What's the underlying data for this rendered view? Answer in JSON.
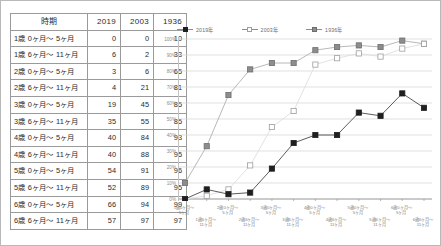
{
  "table": {
    "headers": [
      "時期",
      "2019",
      "2003",
      "1936"
    ],
    "rows": [
      {
        "period": "1歳 0ヶ月～ 5ヶ月",
        "y2019": "0",
        "y2003": "0",
        "y1936": "10"
      },
      {
        "period": "1歳 6ヶ月～ 11ヶ月",
        "y2019": "6",
        "y2003": "2",
        "y1936": "33"
      },
      {
        "period": "2歳 0ヶ月～ 5ヶ月",
        "y2019": "3",
        "y2003": "6",
        "y1936": "65"
      },
      {
        "period": "2歳 6ヶ月～ 11ヶ月",
        "y2019": "4",
        "y2003": "21",
        "y1936": "81"
      },
      {
        "period": "3歳 0ヶ月～ 5ヶ月",
        "y2019": "19",
        "y2003": "45",
        "y1936": "85"
      },
      {
        "period": "3歳 6ヶ月～ 11ヶ月",
        "y2019": "35",
        "y2003": "55",
        "y1936": "85"
      },
      {
        "period": "4歳 0ヶ月～ 5ヶ月",
        "y2019": "40",
        "y2003": "84",
        "y1936": "93"
      },
      {
        "period": "4歳 6ヶ月～ 11ヶ月",
        "y2019": "40",
        "y2003": "88",
        "y1936": "95"
      },
      {
        "period": "5歳 0ヶ月～ 5ヶ月",
        "y2019": "54",
        "y2003": "91",
        "y1936": "96"
      },
      {
        "period": "5歳 6ヶ月～ 11ヶ月",
        "y2019": "52",
        "y2003": "89",
        "y1936": "95"
      },
      {
        "period": "6歳 0ヶ月～ 5ヶ月",
        "y2019": "66",
        "y2003": "94",
        "y1936": "99"
      },
      {
        "period": "6歳 6ヶ月～ 11ヶ月",
        "y2019": "57",
        "y2003": "97",
        "y1936": "97"
      }
    ]
  },
  "chart_data": {
    "type": "line",
    "title": "",
    "xlabel": "",
    "ylabel": "",
    "ylim": [
      0,
      100
    ],
    "ytick_labels": [
      "0%",
      "10%",
      "20%",
      "30%",
      "40%",
      "50%",
      "60%",
      "70%",
      "80%",
      "90%",
      "100%"
    ],
    "ytick_values": [
      0,
      10,
      20,
      30,
      40,
      50,
      60,
      70,
      80,
      90,
      100
    ],
    "grid": true,
    "legend_position": "top-left",
    "categories": [
      "1歳0ヶ月～\n5ヶ月",
      "1歳6ヶ月～\n11ヶ月",
      "2歳0ヶ月～\n5ヶ月",
      "2歳6ヶ月～\n11ヶ月",
      "3歳0ヶ月～\n5ヶ月",
      "3歳6ヶ月～\n11ヶ月",
      "4歳0ヶ月～\n5ヶ月",
      "4歳6ヶ月～\n11ヶ月",
      "5歳0ヶ月～\n5ヶ月",
      "5歳6ヶ月～\n11ヶ月",
      "6歳0ヶ月～\n5ヶ月",
      "6歳6ヶ月～\n11ヶ月"
    ],
    "categories_line1": [
      "1歳0ヶ月～",
      "1歳6ヶ月～",
      "2歳0ヶ月～",
      "2歳6ヶ月～",
      "3歳0ヶ月～",
      "3歳6ヶ月～",
      "4歳0ヶ月～",
      "4歳6ヶ月～",
      "5歳0ヶ月～",
      "5歳6ヶ月～",
      "6歳0ヶ月～",
      "6歳6ヶ月～"
    ],
    "categories_line2": [
      "5ヶ月",
      "11ヶ月",
      "5ヶ月",
      "11ヶ月",
      "5ヶ月",
      "11ヶ月",
      "5ヶ月",
      "11ヶ月",
      "5ヶ月",
      "11ヶ月",
      "5ヶ月",
      "11ヶ月"
    ],
    "series": [
      {
        "name": "2019年",
        "color": "#1f1f1f",
        "marker": "filled-square",
        "values": [
          0,
          6,
          3,
          4,
          19,
          35,
          40,
          40,
          54,
          52,
          66,
          57
        ]
      },
      {
        "name": "2003年",
        "color": "#d8d8d8",
        "marker": "open-square",
        "values": [
          0,
          2,
          6,
          21,
          45,
          55,
          84,
          88,
          91,
          89,
          94,
          97
        ]
      },
      {
        "name": "1936年",
        "color": "#8d8d8d",
        "marker": "gray-square",
        "values": [
          10,
          33,
          65,
          81,
          85,
          85,
          93,
          95,
          96,
          95,
          99,
          97
        ]
      }
    ]
  },
  "legend": {
    "items": [
      {
        "label": "2019年"
      },
      {
        "label": "2003年"
      },
      {
        "label": "1936年"
      }
    ]
  }
}
